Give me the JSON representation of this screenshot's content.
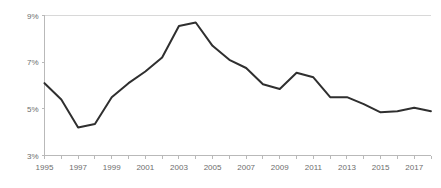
{
  "chart_data": {
    "type": "line",
    "title": "",
    "subtitle": "",
    "xlabel": "",
    "ylabel": "",
    "x": [
      1995,
      1996,
      1997,
      1998,
      1999,
      2000,
      2001,
      2002,
      2003,
      2004,
      2005,
      2006,
      2007,
      2008,
      2009,
      2010,
      2011,
      2012,
      2013,
      2014,
      2015,
      2016,
      2017,
      2018
    ],
    "values": [
      6.1,
      5.4,
      4.2,
      4.35,
      5.5,
      6.1,
      6.6,
      7.2,
      8.55,
      8.7,
      7.7,
      7.1,
      6.75,
      6.05,
      5.85,
      6.55,
      6.35,
      5.5,
      5.5,
      5.2,
      4.85,
      4.9,
      5.05,
      4.9
    ],
    "series": [
      {
        "name": "rate",
        "values": [
          6.1,
          5.4,
          4.2,
          4.35,
          5.5,
          6.1,
          6.6,
          7.2,
          8.55,
          8.7,
          7.7,
          7.1,
          6.75,
          6.05,
          5.85,
          6.55,
          6.35,
          5.5,
          5.5,
          5.2,
          4.85,
          4.9,
          5.05,
          4.9
        ],
        "color": "#2f2f2f"
      }
    ],
    "xlim": [
      1995,
      2018
    ],
    "ylim": [
      3,
      9
    ],
    "ytick_values": [
      3,
      5,
      7,
      9
    ],
    "ytick_labels": [
      "3%",
      "5%",
      "7%",
      "9%"
    ],
    "xtick_values": [
      1995,
      1997,
      1999,
      2001,
      2003,
      2005,
      2007,
      2009,
      2011,
      2013,
      2015,
      2017
    ],
    "xtick_labels": [
      "1995",
      "1997",
      "1999",
      "2001",
      "2003",
      "2005",
      "2007",
      "2009",
      "2011",
      "2013",
      "2015",
      "2017"
    ],
    "grid": "top-only",
    "legend": "none",
    "axis_color": "#b9b9b9",
    "grid_color": "#d8d8d8",
    "tick_label_color": "#6d6d6d",
    "background_color": "#ffffff"
  }
}
